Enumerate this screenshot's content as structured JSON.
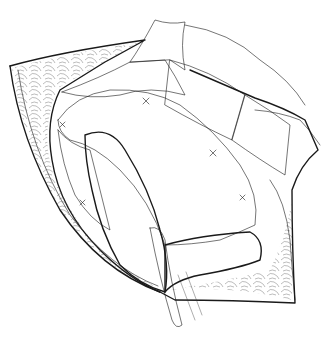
{
  "image": {
    "subject": "surgical line drawing of mesh repair in an open wound",
    "style": "black-and-white pen illustration",
    "colors": {
      "ink": "#1a1a1a",
      "background": "#ffffff"
    }
  }
}
